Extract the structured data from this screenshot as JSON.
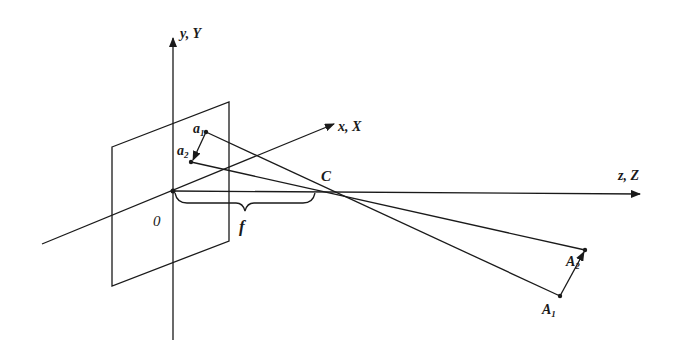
{
  "diagram": {
    "axes": {
      "y": {
        "label": "y, Y"
      },
      "x": {
        "label": "x, X"
      },
      "z": {
        "label": "z, Z"
      }
    },
    "points": {
      "origin": {
        "label": "0"
      },
      "center": {
        "label": "C"
      },
      "a1": {
        "label": "a",
        "sub": "1"
      },
      "a2": {
        "label": "a",
        "sub": "2"
      },
      "A1": {
        "label": "A",
        "sub": "1"
      },
      "A2": {
        "label": "A",
        "sub": "2"
      }
    },
    "focal_length": {
      "label": "f"
    },
    "colors": {
      "line": "#1a1a1a",
      "background": "#ffffff"
    }
  }
}
